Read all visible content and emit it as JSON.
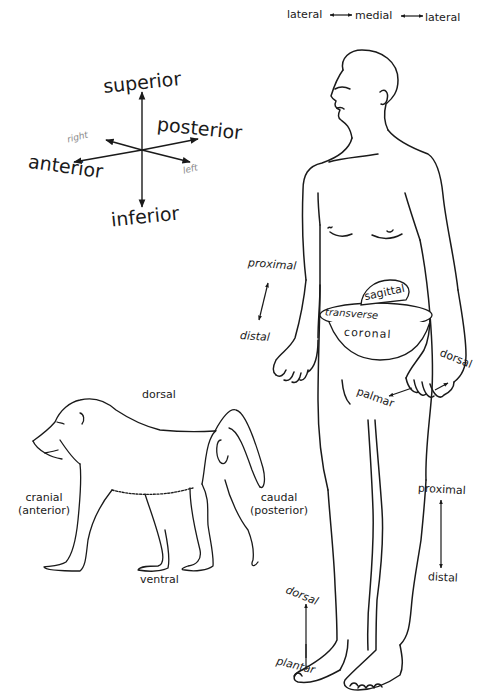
{
  "diagram": {
    "axes_compass": {
      "superior": "superior",
      "inferior": "inferior",
      "anterior": "anterior",
      "posterior": "posterior",
      "right": "right",
      "left": "left"
    },
    "human": {
      "lateral_left": "lateral",
      "medial": "medial",
      "lateral_right": "lateral",
      "arm_proximal": "proximal",
      "arm_distal": "distal",
      "planes": {
        "sagittal": "sagittal",
        "transverse": "transverse",
        "coronal": "coronal"
      },
      "hand_dorsal": "dorsal",
      "hand_palmar": "palmar",
      "leg_proximal": "proximal",
      "leg_distal": "distal",
      "foot_dorsal": "dorsal",
      "foot_plantar": "plantar"
    },
    "baboon": {
      "dorsal": "dorsal",
      "ventral": "ventral",
      "cranial": "cranial",
      "cranial_alt": "(anterior)",
      "caudal": "caudal",
      "caudal_alt": "(posterior)"
    },
    "colors": {
      "line": "#1a1a1a",
      "background": "#ffffff"
    }
  }
}
